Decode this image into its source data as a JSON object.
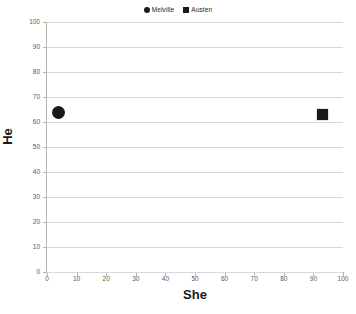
{
  "chart_data": {
    "type": "scatter",
    "title": "",
    "xlabel": "She",
    "ylabel": "He",
    "xlim": [
      0,
      100
    ],
    "ylim": [
      0,
      100
    ],
    "xticks": [
      0,
      10,
      20,
      30,
      40,
      50,
      60,
      70,
      80,
      90,
      100
    ],
    "yticks": [
      0,
      10,
      20,
      30,
      40,
      50,
      60,
      70,
      80,
      90,
      100
    ],
    "grid": "horizontal",
    "legend_position": "top-center",
    "series": [
      {
        "name": "Melville",
        "marker": "circle",
        "color": "#1a1a1a",
        "points": [
          {
            "x": 4,
            "y": 64
          }
        ]
      },
      {
        "name": "Austen",
        "marker": "square",
        "color": "#1a1a1a",
        "points": [
          {
            "x": 93,
            "y": 63
          }
        ]
      }
    ]
  },
  "legend": {
    "entries": [
      {
        "label": "Melville",
        "marker": "circle-marker-icon"
      },
      {
        "label": "Austen",
        "marker": "square-marker-icon"
      }
    ]
  },
  "axes": {
    "x": {
      "title": "She",
      "tick_labels": [
        "0",
        "10",
        "20",
        "30",
        "40",
        "50",
        "60",
        "70",
        "80",
        "90",
        "100"
      ]
    },
    "y": {
      "title": "He",
      "tick_labels": [
        "0",
        "10",
        "20",
        "30",
        "40",
        "50",
        "60",
        "70",
        "80",
        "90",
        "100"
      ]
    }
  }
}
